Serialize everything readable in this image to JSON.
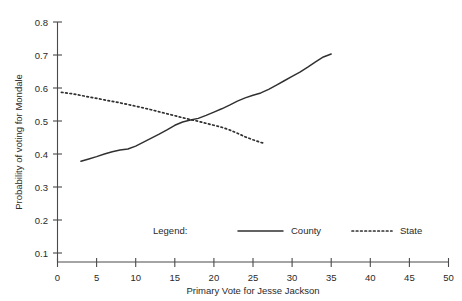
{
  "chart_data": {
    "type": "line",
    "title": "",
    "xlabel": "Primary Vote for Jesse Jackson",
    "ylabel": "Probability of voting for Mondale",
    "xlim": [
      0,
      50
    ],
    "ylim": [
      0.1,
      0.8
    ],
    "xticks": [
      0,
      5,
      10,
      15,
      20,
      25,
      30,
      35,
      40,
      45,
      50
    ],
    "xtick_labels": [
      "0",
      "5",
      "10",
      "15",
      "20",
      "25",
      "30",
      "35",
      "40",
      "45",
      "50"
    ],
    "yticks": [
      0.1,
      0.2,
      0.3,
      0.4,
      0.5,
      0.6,
      0.7,
      0.8
    ],
    "ytick_labels": [
      "0.1",
      "0.2",
      "0.3",
      "0.4",
      "0.5",
      "0.6",
      "0.7",
      "0.8"
    ],
    "grid": false,
    "legend_position": "inside-bottom-center",
    "series": [
      {
        "name": "County",
        "style": "solid",
        "color": "#303030",
        "x": [
          3.0,
          4.0,
          5.0,
          6.0,
          7.0,
          8.0,
          9.0,
          10.0,
          11.0,
          12.0,
          13.0,
          14.0,
          15.0,
          16.0,
          17.0,
          18.0,
          19.0,
          20.0,
          21.0,
          22.0,
          23.0,
          24.0,
          25.0,
          26.0,
          27.0,
          28.0,
          29.0,
          30.0,
          31.0,
          32.0,
          33.0,
          34.0,
          35.0
        ],
        "y": [
          0.378,
          0.385,
          0.392,
          0.4,
          0.407,
          0.412,
          0.415,
          0.424,
          0.436,
          0.448,
          0.46,
          0.473,
          0.487,
          0.497,
          0.503,
          0.508,
          0.517,
          0.527,
          0.537,
          0.548,
          0.56,
          0.57,
          0.578,
          0.585,
          0.596,
          0.609,
          0.622,
          0.635,
          0.648,
          0.663,
          0.679,
          0.694,
          0.703
        ]
      },
      {
        "name": "State",
        "style": "dotted",
        "color": "#303030",
        "x": [
          0.5,
          2.0,
          4.0,
          6.0,
          8.0,
          10.0,
          12.0,
          14.0,
          16.0,
          18.0,
          20.0,
          21.0,
          22.0,
          23.0,
          24.0,
          25.0,
          26.0,
          26.5
        ],
        "y": [
          0.587,
          0.582,
          0.573,
          0.564,
          0.555,
          0.545,
          0.534,
          0.522,
          0.51,
          0.499,
          0.487,
          0.481,
          0.473,
          0.463,
          0.452,
          0.443,
          0.435,
          0.432
        ]
      }
    ],
    "annotations": []
  },
  "legend": {
    "label": "Legend:",
    "entries": [
      {
        "name": "County",
        "style": "solid"
      },
      {
        "name": "State",
        "style": "dotted"
      }
    ]
  }
}
